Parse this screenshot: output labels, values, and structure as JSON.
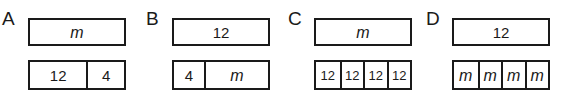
{
  "figure": {
    "type": "tape-diagram-set",
    "background_color": "#ffffff",
    "line_color": "#1a1a1a",
    "groups": [
      {
        "id": "a",
        "label": "A",
        "top_bar": {
          "cells": [
            {
              "text": "m",
              "style": "var"
            }
          ]
        },
        "bottom_bar": {
          "cells": [
            {
              "text": "12",
              "style": "num"
            },
            {
              "text": "4",
              "style": "num"
            }
          ]
        }
      },
      {
        "id": "b",
        "label": "B",
        "top_bar": {
          "cells": [
            {
              "text": "12",
              "style": "num"
            }
          ]
        },
        "bottom_bar": {
          "cells": [
            {
              "text": "4",
              "style": "num"
            },
            {
              "text": "m",
              "style": "var"
            }
          ]
        }
      },
      {
        "id": "c",
        "label": "C",
        "top_bar": {
          "cells": [
            {
              "text": "m",
              "style": "var"
            }
          ]
        },
        "bottom_bar": {
          "cells": [
            {
              "text": "12",
              "style": "num"
            },
            {
              "text": "12",
              "style": "num"
            },
            {
              "text": "12",
              "style": "num"
            },
            {
              "text": "12",
              "style": "num"
            }
          ]
        }
      },
      {
        "id": "d",
        "label": "D",
        "top_bar": {
          "cells": [
            {
              "text": "12",
              "style": "num"
            }
          ]
        },
        "bottom_bar": {
          "cells": [
            {
              "text": "m",
              "style": "var"
            },
            {
              "text": "m",
              "style": "var"
            },
            {
              "text": "m",
              "style": "var"
            },
            {
              "text": "m",
              "style": "var"
            }
          ]
        }
      }
    ]
  }
}
